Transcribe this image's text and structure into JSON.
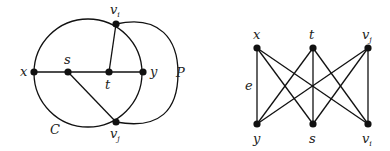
{
  "graphs": [
    {
      "id": "left",
      "vertices": [
        {
          "id": "x",
          "label": "x"
        },
        {
          "id": "s",
          "label": "s"
        },
        {
          "id": "t",
          "label": "t"
        },
        {
          "id": "y",
          "label": "y"
        },
        {
          "id": "vi",
          "label": "v",
          "sub": "i"
        },
        {
          "id": "vj",
          "label": "v",
          "sub": "j"
        }
      ],
      "edges": [
        [
          "x",
          "s"
        ],
        [
          "s",
          "t"
        ],
        [
          "t",
          "y"
        ],
        [
          "t",
          "vi"
        ],
        [
          "s",
          "vj"
        ]
      ],
      "cycle_label": "C",
      "path_label": "P"
    },
    {
      "id": "right",
      "top_row": [
        {
          "id": "x",
          "label": "x"
        },
        {
          "id": "t",
          "label": "t"
        },
        {
          "id": "vj",
          "label": "v",
          "sub": "j"
        }
      ],
      "bottom_row": [
        {
          "id": "y",
          "label": "y"
        },
        {
          "id": "s",
          "label": "s"
        },
        {
          "id": "vi",
          "label": "v",
          "sub": "i"
        }
      ],
      "edge_label": "e",
      "edges": "complete bipartite K3,3"
    }
  ]
}
